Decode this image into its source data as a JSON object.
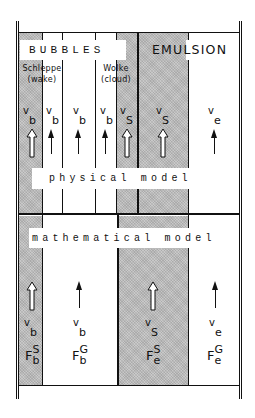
{
  "diagram": {
    "upper": {
      "group_labels": {
        "bubbles": "BUBBLES",
        "emulsion": "EMULSION"
      },
      "sublabels": {
        "wake_de": "Schleppe",
        "wake_en": "(wake)",
        "cloud_de": "Wolke",
        "cloud_en": "(cloud)"
      },
      "columns": [
        {
          "name": "wake",
          "velocity_base": "v",
          "velocity_sub": "b",
          "arrow": "hollow",
          "shaded": true
        },
        {
          "name": "bubble-1",
          "velocity_base": "v",
          "velocity_sub": "b",
          "arrow": "solid",
          "shaded": false
        },
        {
          "name": "bubble-2",
          "velocity_base": "v",
          "velocity_sub": "b",
          "arrow": "solid",
          "shaded": false
        },
        {
          "name": "bubble-3",
          "velocity_base": "v",
          "velocity_sub": "b",
          "arrow": "solid",
          "shaded": false
        },
        {
          "name": "cloud",
          "velocity_base": "v",
          "velocity_sub": "S",
          "arrow": "hollow",
          "shaded": true
        },
        {
          "name": "emulsion-solid",
          "velocity_base": "v",
          "velocity_sub": "S",
          "arrow": "hollow",
          "shaded": true
        },
        {
          "name": "emulsion-gas",
          "velocity_base": "v",
          "velocity_sub": "e",
          "arrow": "solid",
          "shaded": false
        }
      ],
      "section_label": "physical model"
    },
    "lower": {
      "section_label": "mathematical model",
      "columns": [
        {
          "name": "bubble-solid",
          "velocity_base": "v",
          "velocity_sub": "b",
          "flux_base": "F",
          "flux_sup": "S",
          "flux_sub": "b",
          "arrow": "hollow",
          "shaded": true
        },
        {
          "name": "bubble-gas",
          "velocity_base": "v",
          "velocity_sub": "b",
          "flux_base": "F",
          "flux_sup": "G",
          "flux_sub": "b",
          "arrow": "solid",
          "shaded": false
        },
        {
          "name": "emulsion-solid",
          "velocity_base": "v",
          "velocity_sub": "S",
          "flux_base": "F",
          "flux_sup": "S",
          "flux_sub": "e",
          "arrow": "hollow",
          "shaded": true
        },
        {
          "name": "emulsion-gas",
          "velocity_base": "v",
          "velocity_sub": "e",
          "flux_base": "F",
          "flux_sup": "G",
          "flux_sub": "e",
          "arrow": "solid",
          "shaded": false
        }
      ]
    },
    "colors": {
      "line": "#111111",
      "shading": "#c9c9c9",
      "background": "#ffffff"
    }
  }
}
